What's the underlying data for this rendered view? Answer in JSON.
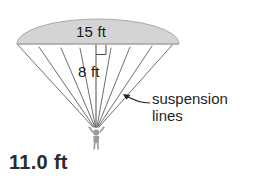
{
  "figure": {
    "background_color": "#ffffff"
  },
  "canopy": {
    "name": "parachute canopy",
    "fill_color": "#d4d4d4",
    "stroke_color": "#a8a8a8",
    "width_label": "15 ft",
    "height_label": "8 ft"
  },
  "right_angle_marker": {
    "present": true,
    "label": ""
  },
  "callout": {
    "line1": "suspension",
    "line2": "lines"
  },
  "measurements": {
    "line_length": "11.0 ft"
  },
  "lines": {
    "count": 9,
    "stroke_color": "#6e6e6e"
  },
  "skydiver": {
    "name": "skydiver figure",
    "fill_color": "#9a9a9a"
  },
  "colors": {
    "text": "#1a1a1a",
    "bold_text": "#2b2b2b",
    "canopy": "#d4d4d4",
    "stroke": "#6e6e6e"
  }
}
